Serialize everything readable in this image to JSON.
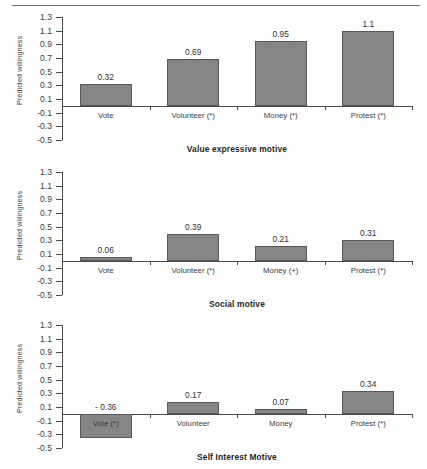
{
  "figure": {
    "y_axis_title": "Predicted willingness",
    "y_ticks": [
      "1.3",
      "1.1",
      "0.9",
      "0.7",
      "0.5",
      "0.3",
      "0.1",
      "-0.1",
      "-0.3",
      "-0.5"
    ],
    "bar_color": "#858585",
    "bar_edge_color": "#585858",
    "axis_color": "#4a4a4a"
  },
  "chart_data": [
    {
      "type": "bar",
      "title": "Value expressive motive",
      "xlabel": "",
      "ylabel": "Predicted willingness",
      "ylim": [
        -0.5,
        1.3
      ],
      "ytick_step": 0.2,
      "grid": false,
      "legend": "none",
      "categories": [
        "Vote",
        "Volunteer (*)",
        "Money (*)",
        "Protest (*)"
      ],
      "values": [
        0.32,
        0.69,
        0.95,
        1.1
      ],
      "value_labels": [
        "0.32",
        "0.69",
        "0.95",
        "1.1"
      ]
    },
    {
      "type": "bar",
      "title": "Social motive",
      "xlabel": "",
      "ylabel": "Predicted willingness",
      "ylim": [
        -0.5,
        1.3
      ],
      "ytick_step": 0.2,
      "grid": false,
      "legend": "none",
      "categories": [
        "Vote",
        "Volunteer (*)",
        "Money (+)",
        "Protest (*)"
      ],
      "values": [
        0.06,
        0.39,
        0.21,
        0.31
      ],
      "value_labels": [
        "0.06",
        "0.39",
        "0.21",
        "0.31"
      ]
    },
    {
      "type": "bar",
      "title": "Self Interest Motive",
      "xlabel": "",
      "ylabel": "Predicted willingness",
      "ylim": [
        -0.5,
        1.3
      ],
      "ytick_step": 0.2,
      "grid": false,
      "legend": "none",
      "categories": [
        "Vote (*)",
        "Volunteer",
        "Money",
        "Protest (*)"
      ],
      "values": [
        -0.36,
        0.17,
        0.07,
        0.34
      ],
      "value_labels": [
        "- 0.36",
        "0.17",
        "0.07",
        "0.34"
      ]
    }
  ]
}
